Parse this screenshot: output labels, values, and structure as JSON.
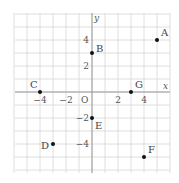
{
  "diagram": {
    "type": "coordinate-plane",
    "axes": {
      "x_label": "x",
      "y_label": "y",
      "origin_label": "O"
    },
    "range": {
      "x": [
        -6,
        6
      ],
      "y": [
        -6,
        6
      ]
    },
    "x_ticks": [
      {
        "value": -4,
        "label": "−4"
      },
      {
        "value": -2,
        "label": "−2"
      },
      {
        "value": 2,
        "label": "2"
      },
      {
        "value": 4,
        "label": "4"
      }
    ],
    "y_ticks": [
      {
        "value": 4,
        "label": "4"
      },
      {
        "value": 2,
        "label": "2"
      },
      {
        "value": -2,
        "label": "−2"
      },
      {
        "value": -4,
        "label": "−4"
      }
    ],
    "points": [
      {
        "name": "A",
        "x": 5,
        "y": 4
      },
      {
        "name": "B",
        "x": 0,
        "y": 3
      },
      {
        "name": "C",
        "x": -4,
        "y": 0
      },
      {
        "name": "D",
        "x": -3,
        "y": -4
      },
      {
        "name": "E",
        "x": 0,
        "y": -2
      },
      {
        "name": "F",
        "x": 4,
        "y": -5
      },
      {
        "name": "G",
        "x": 3,
        "y": 0
      }
    ]
  },
  "colors": {
    "grid": "#d6d6d6",
    "axis": "#9a9a9a",
    "point": "#111111",
    "text": "#444444"
  }
}
